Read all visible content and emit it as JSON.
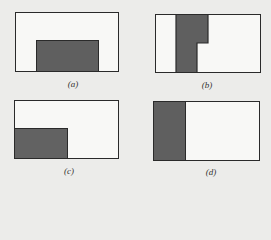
{
  "figure": {
    "panels": [
      {
        "id": "a",
        "label": "(a)",
        "description": "shaded rectangle at bottom-center of frame"
      },
      {
        "id": "b",
        "label": "(b)",
        "description": "shaded L-shaped (step) vertical region near left, wider at top"
      },
      {
        "id": "c",
        "label": "(c)",
        "description": "shaded rectangle at bottom-left of frame"
      },
      {
        "id": "d",
        "label": "(d)",
        "description": "shaded vertical strip along left edge of frame"
      }
    ],
    "colors": {
      "background": "#ececea",
      "frame_fill": "#f8f8f6",
      "frame_stroke": "#2a2a2a",
      "shade_fill": "#5f5f5f"
    }
  }
}
